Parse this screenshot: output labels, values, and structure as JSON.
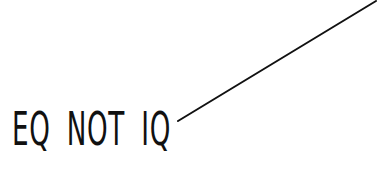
{
  "caption": {
    "text": "EQ NOT IQ",
    "color": "#111111"
  },
  "pointer_line": {
    "x1": 178,
    "y1": 121,
    "x2": 376,
    "y2": 1,
    "color": "#111111"
  }
}
